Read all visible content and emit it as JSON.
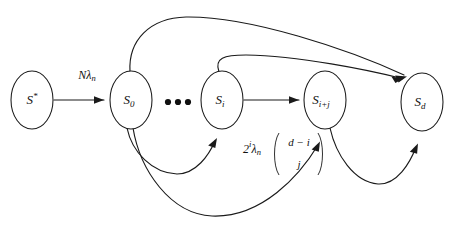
{
  "diagram": {
    "background_color": "#ffffff",
    "stroke_color": "#1a1a1a",
    "nodes": [
      {
        "id": "s-star",
        "label_base": "S",
        "label_sub": "*",
        "cx": 32,
        "cy": 100,
        "rx": 21,
        "ry": 29
      },
      {
        "id": "s-zero",
        "label_base": "S",
        "label_sub": "0",
        "cx": 131,
        "cy": 100,
        "rx": 21,
        "ry": 29
      },
      {
        "id": "s-i",
        "label_base": "S",
        "label_sub": "i",
        "cx": 222,
        "cy": 100,
        "rx": 21,
        "ry": 29
      },
      {
        "id": "s-i-plus-j",
        "label_base": "S",
        "label_sub": "i+j",
        "cx": 325,
        "cy": 100,
        "rx": 21,
        "ry": 29
      },
      {
        "id": "s-d",
        "label_base": "S",
        "label_sub": "d",
        "cx": 422,
        "cy": 102,
        "rx": 21,
        "ry": 29
      }
    ],
    "ellipsis": {
      "label": "•••",
      "cx": 177,
      "cy": 102
    },
    "edges": [
      {
        "id": "edge-sstar-s0",
        "from": "s-star",
        "to": "s-zero",
        "style": "straight"
      },
      {
        "id": "edge-si-sij",
        "from": "s-i",
        "to": "s-i-plus-j",
        "style": "straight"
      },
      {
        "id": "edge-s0-sd",
        "from": "s-zero",
        "to": "s-d",
        "style": "arc-above"
      },
      {
        "id": "edge-si-sd",
        "from": "s-i",
        "to": "s-d",
        "style": "arc-above"
      },
      {
        "id": "edge-s0-si",
        "from": "s-zero",
        "to": "s-i",
        "style": "arc-below"
      },
      {
        "id": "edge-s0-sij",
        "from": "s-zero",
        "to": "s-i-plus-j",
        "style": "arc-below"
      },
      {
        "id": "edge-sij-sd",
        "from": "s-i-plus-j",
        "to": "s-d",
        "style": "arc-below"
      }
    ],
    "labels": {
      "rate_initial": {
        "base": "N",
        "lambda": "λ",
        "sub": "n",
        "x": 87,
        "y": 76
      },
      "rate_transition": {
        "coefficient_base": "2",
        "coefficient_sup": "i",
        "lambda": "λ",
        "lambda_sub": "n",
        "binom_top": "d − i",
        "binom_bottom": "j",
        "x": 252,
        "y": 150
      }
    }
  }
}
